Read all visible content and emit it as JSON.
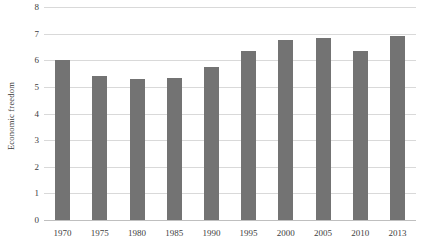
{
  "chart_data": {
    "type": "bar",
    "title": "",
    "subtitle": "",
    "xlabel": "",
    "ylabel": "Economic freedom",
    "categories": [
      "1970",
      "1975",
      "1980",
      "1985",
      "1990",
      "1995",
      "2000",
      "2005",
      "2010",
      "2013"
    ],
    "values": [
      6.0,
      5.4,
      5.3,
      5.35,
      5.75,
      6.35,
      6.75,
      6.85,
      6.35,
      6.9
    ],
    "series": [
      {
        "name": "Economic freedom",
        "values": [
          6.0,
          5.4,
          5.3,
          5.35,
          5.75,
          6.35,
          6.75,
          6.85,
          6.35,
          6.9
        ]
      }
    ],
    "ylim": [
      0,
      8
    ],
    "yticks": [
      0,
      1,
      2,
      3,
      4,
      5,
      6,
      7,
      8
    ],
    "ytick_labels": [
      "0",
      "1",
      "2",
      "3",
      "4",
      "5",
      "6",
      "7",
      "8"
    ],
    "grid": "horizontal",
    "legend": "none",
    "bar_color": "#737373",
    "gridline_color": "#d9d9d9",
    "axis_color": "#bfbfbf",
    "text_color": "#404040",
    "background": "#ffffff"
  }
}
